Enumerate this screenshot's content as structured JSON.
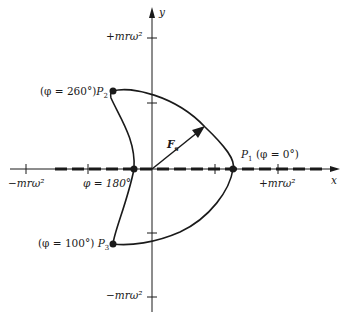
{
  "axes": {
    "x_label": "x",
    "y_label": "y",
    "y_pos_tick": "+mrω²",
    "y_neg_tick": "−mrω²",
    "x_pos_tick": "+mrω²",
    "x_neg_tick": "−mrω²"
  },
  "points": {
    "p1": {
      "name": "P",
      "sub": "1",
      "angle": "(φ = 0°)"
    },
    "p2": {
      "name": "P",
      "sub": "2",
      "angle": "(φ = 260°)"
    },
    "p3": {
      "name": "P",
      "sub": "3",
      "angle": "(φ = 100°)"
    },
    "p180": {
      "label": "φ = 180°"
    }
  },
  "vector": {
    "name": "F",
    "sub": "s"
  },
  "colors": {
    "ink": "#1a1a1a",
    "background": "#ffffff"
  }
}
